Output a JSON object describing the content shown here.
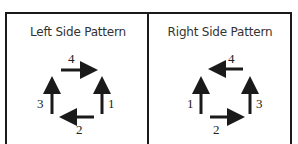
{
  "panels": [
    {
      "title": "Left Side Pattern",
      "steps": [
        {
          "n": "1",
          "direction": "up",
          "position": "right"
        },
        {
          "n": "2",
          "direction": "left",
          "position": "bottom"
        },
        {
          "n": "3",
          "direction": "up",
          "position": "left"
        },
        {
          "n": "4",
          "direction": "right",
          "position": "top"
        }
      ]
    },
    {
      "title": "Right Side Pattern",
      "steps": [
        {
          "n": "1",
          "direction": "up",
          "position": "left"
        },
        {
          "n": "2",
          "direction": "right",
          "position": "bottom"
        },
        {
          "n": "3",
          "direction": "up",
          "position": "right"
        },
        {
          "n": "4",
          "direction": "left",
          "position": "top"
        }
      ]
    }
  ],
  "colors": {
    "stroke": "#1a1a1a",
    "text": "#333333"
  }
}
